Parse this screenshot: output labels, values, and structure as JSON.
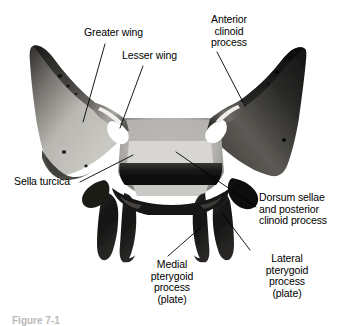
{
  "figure": {
    "view": "superior and posterior view",
    "caption_fragment": "Figure 7-1",
    "background_color": "#ffffff",
    "label_color": "#000000",
    "leader_line_color": "#000000"
  },
  "labels": {
    "greater_wing": "Greater wing",
    "lesser_wing": "Lesser wing",
    "anterior_clinoid_process": "Anterior\nclinoid\nprocess",
    "sella_turcica": "Sella turcica",
    "dorsum_sellae": "Dorsum sellae\nand posterior\nclinoid process",
    "medial_pterygoid": "Medial\npterygoid\nprocess\n(plate)",
    "lateral_pterygoid": "Lateral\npterygoid\nprocess\n(plate)"
  },
  "anatomy_parts": [
    {
      "name": "greater-wing-left",
      "tone": "#b4b2ae"
    },
    {
      "name": "greater-wing-right",
      "tone": "#3b3936"
    },
    {
      "name": "lesser-wing-left",
      "tone": "#8e8c88"
    },
    {
      "name": "lesser-wing-right",
      "tone": "#4a4846"
    },
    {
      "name": "sella-turcica-body",
      "tone": "#cfcdc9"
    },
    {
      "name": "dorsum-sellae",
      "tone": "#1d1c1b"
    },
    {
      "name": "medial-pterygoid-plate",
      "tone": "#201f1e"
    },
    {
      "name": "lateral-pterygoid-plate",
      "tone": "#2a2927"
    },
    {
      "name": "optic-foramen-left",
      "tone": "#ffffff"
    },
    {
      "name": "optic-foramen-right",
      "tone": "#ffffff"
    }
  ]
}
